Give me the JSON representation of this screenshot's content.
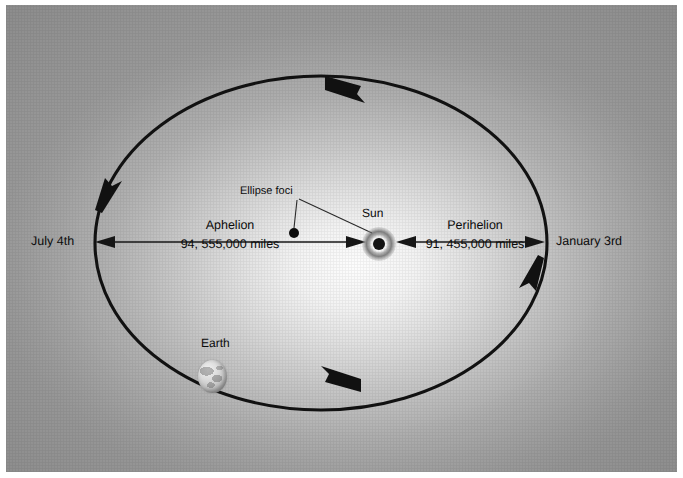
{
  "figure": {
    "background_color": "#a8a8a8",
    "ink_color": "#0b0b0b"
  },
  "orbit": {
    "direction": "counterclockwise",
    "arrow_positions": [
      "top",
      "left",
      "bottom",
      "right"
    ]
  },
  "labels": {
    "aphelion_endpoint": "July 4th",
    "perihelion_endpoint": "January 3rd",
    "foci": "Ellipse foci",
    "sun": "Sun",
    "earth": "Earth"
  },
  "measurements": [
    {
      "name": "Aphelion",
      "value": "94, 555,000 miles",
      "side": "left",
      "endpoint_label": "July 4th"
    },
    {
      "name": "Perihelion",
      "value": "91, 455,000 miles",
      "side": "right",
      "endpoint_label": "January 3rd"
    }
  ],
  "bodies": [
    {
      "name": "Sun",
      "kind": "star-icon"
    },
    {
      "name": "Earth",
      "kind": "planet-icon"
    },
    {
      "name": "Ellipse foci",
      "kind": "focus-dot-icon"
    }
  ]
}
